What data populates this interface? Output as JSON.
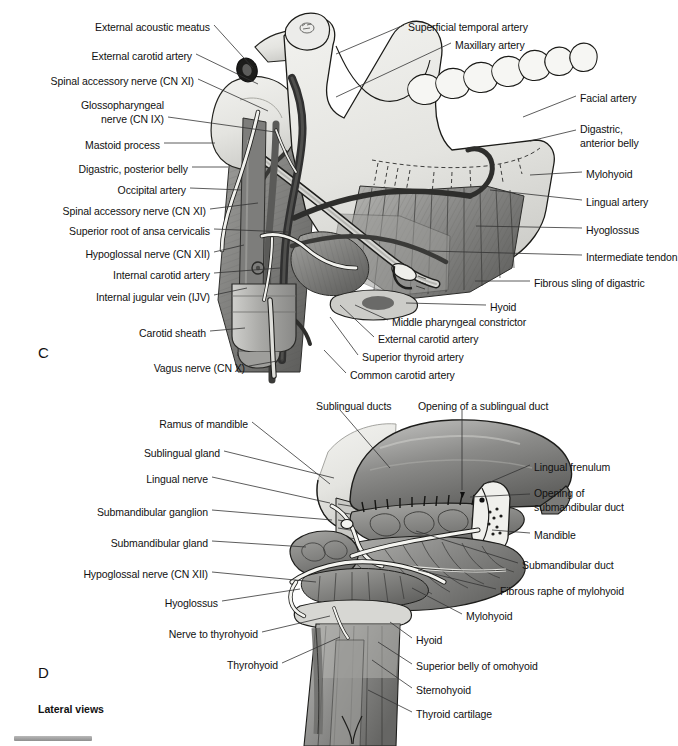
{
  "figure": {
    "caption": "Lateral views",
    "panels": [
      {
        "letter": "C",
        "x": 38,
        "y": 344
      },
      {
        "letter": "D",
        "x": 38,
        "y": 664
      }
    ]
  },
  "panel_c": {
    "labels_left": [
      {
        "text": "External acoustic meatus",
        "x": 210,
        "y": 21,
        "anchor": "right",
        "lx": 214,
        "ly": 25,
        "tx": 253,
        "ty": 68
      },
      {
        "text": "External carotid artery",
        "x": 192,
        "y": 50,
        "anchor": "right",
        "lx": 196,
        "ly": 54,
        "tx": 258,
        "ty": 84
      },
      {
        "text": "Spinal accessory nerve (CN XI)",
        "x": 194,
        "y": 75,
        "anchor": "right",
        "lx": 198,
        "ly": 79,
        "tx": 268,
        "ty": 111
      },
      {
        "text": "Glossopharyngeal",
        "x": 164,
        "y": 99,
        "anchor": "right",
        "lx": 0,
        "ly": 0,
        "tx": 0,
        "ty": 0
      },
      {
        "text": "nerve (CN IX)",
        "x": 164,
        "y": 113,
        "anchor": "right",
        "lx": 168,
        "ly": 117,
        "tx": 275,
        "ty": 132
      },
      {
        "text": "Mastoid process",
        "x": 160,
        "y": 139,
        "anchor": "right",
        "lx": 164,
        "ly": 143,
        "tx": 215,
        "ty": 143
      },
      {
        "text": "Digastric, posterior belly",
        "x": 188,
        "y": 163,
        "anchor": "right",
        "lx": 192,
        "ly": 167,
        "tx": 228,
        "ty": 167
      },
      {
        "text": "Occipital artery",
        "x": 186,
        "y": 184,
        "anchor": "right",
        "lx": 190,
        "ly": 188,
        "tx": 242,
        "ty": 190
      },
      {
        "text": "Spinal accessory nerve (CN XI)",
        "x": 206,
        "y": 205,
        "anchor": "right",
        "lx": 210,
        "ly": 209,
        "tx": 258,
        "ty": 203
      },
      {
        "text": "Superior root of ansa cervicalis",
        "x": 210,
        "y": 225,
        "anchor": "right",
        "lx": 214,
        "ly": 229,
        "tx": 288,
        "ty": 232
      },
      {
        "text": "Hypoglossal nerve (CN XII)",
        "x": 210,
        "y": 248,
        "anchor": "right",
        "lx": 214,
        "ly": 252,
        "tx": 244,
        "ty": 245
      },
      {
        "text": "Internal carotid artery",
        "x": 210,
        "y": 269,
        "anchor": "right",
        "lx": 214,
        "ly": 273,
        "tx": 280,
        "ty": 268
      },
      {
        "text": "Internal jugular vein (IJV)",
        "x": 210,
        "y": 291,
        "anchor": "right",
        "lx": 214,
        "ly": 295,
        "tx": 247,
        "ty": 288
      },
      {
        "text": "Carotid sheath",
        "x": 206,
        "y": 327,
        "anchor": "right",
        "lx": 210,
        "ly": 331,
        "tx": 245,
        "ty": 328
      },
      {
        "text": "Vagus nerve (CN X)",
        "x": 245,
        "y": 362,
        "anchor": "right",
        "lx": 249,
        "ly": 366,
        "tx": 283,
        "ty": 360
      }
    ],
    "labels_right": [
      {
        "text": "Superficial temporal artery",
        "x": 408,
        "y": 21,
        "anchor": "left",
        "lx": 404,
        "ly": 25,
        "tx": 336,
        "ty": 54
      },
      {
        "text": "Maxillary artery",
        "x": 455,
        "y": 39,
        "anchor": "left",
        "lx": 451,
        "ly": 43,
        "tx": 336,
        "ty": 97
      },
      {
        "text": "Facial artery",
        "x": 580,
        "y": 92,
        "anchor": "left",
        "lx": 576,
        "ly": 96,
        "tx": 523,
        "ty": 117
      },
      {
        "text": "Digastric,",
        "x": 580,
        "y": 123,
        "anchor": "left",
        "lx": 0,
        "ly": 0,
        "tx": 0,
        "ty": 0
      },
      {
        "text": "anterior belly",
        "x": 580,
        "y": 137,
        "anchor": "left",
        "lx": 576,
        "ly": 130,
        "tx": 530,
        "ty": 141
      },
      {
        "text": "Mylohyoid",
        "x": 586,
        "y": 168,
        "anchor": "left",
        "lx": 582,
        "ly": 172,
        "tx": 530,
        "ty": 175
      },
      {
        "text": "Lingual artery",
        "x": 586,
        "y": 196,
        "anchor": "left",
        "lx": 582,
        "ly": 200,
        "tx": 490,
        "ty": 190
      },
      {
        "text": "Hyoglossus",
        "x": 586,
        "y": 224,
        "anchor": "left",
        "lx": 582,
        "ly": 228,
        "tx": 476,
        "ty": 226
      },
      {
        "text": "Intermediate tendon",
        "x": 586,
        "y": 251,
        "anchor": "left",
        "lx": 582,
        "ly": 255,
        "tx": 428,
        "ty": 251
      },
      {
        "text": "Fibrous sling of digastric",
        "x": 534,
        "y": 277,
        "anchor": "left",
        "lx": 530,
        "ly": 281,
        "tx": 475,
        "ty": 281
      },
      {
        "text": "Hyoid",
        "x": 490,
        "y": 301,
        "anchor": "left",
        "lx": 486,
        "ly": 305,
        "tx": 406,
        "ty": 303
      },
      {
        "text": "Middle pharyngeal constrictor",
        "x": 392,
        "y": 316,
        "anchor": "left",
        "lx": 388,
        "ly": 320,
        "tx": 355,
        "ty": 305
      },
      {
        "text": "External carotid artery",
        "x": 378,
        "y": 333,
        "anchor": "left",
        "lx": 374,
        "ly": 337,
        "tx": 340,
        "ty": 305
      },
      {
        "text": "Superior thyroid artery",
        "x": 362,
        "y": 351,
        "anchor": "left",
        "lx": 358,
        "ly": 355,
        "tx": 330,
        "ty": 317
      },
      {
        "text": "Common carotid artery",
        "x": 350,
        "y": 369,
        "anchor": "left",
        "lx": 346,
        "ly": 373,
        "tx": 324,
        "ty": 350
      }
    ]
  },
  "panel_d": {
    "labels_left": [
      {
        "text": "Ramus of mandible",
        "x": 248,
        "y": 418,
        "anchor": "right",
        "lx": 252,
        "ly": 422,
        "tx": 330,
        "ty": 484
      },
      {
        "text": "Sublingual gland",
        "x": 220,
        "y": 447,
        "anchor": "right",
        "lx": 224,
        "ly": 451,
        "tx": 334,
        "ty": 478
      },
      {
        "text": "Lingual nerve",
        "x": 208,
        "y": 473,
        "anchor": "right",
        "lx": 212,
        "ly": 477,
        "tx": 330,
        "ty": 503
      },
      {
        "text": "Submandibular ganglion",
        "x": 208,
        "y": 506,
        "anchor": "right",
        "lx": 212,
        "ly": 510,
        "tx": 332,
        "ty": 520
      },
      {
        "text": "Submandibular gland",
        "x": 208,
        "y": 537,
        "anchor": "right",
        "lx": 212,
        "ly": 541,
        "tx": 306,
        "ty": 547
      },
      {
        "text": "Hypoglossal nerve (CN XII)",
        "x": 208,
        "y": 568,
        "anchor": "right",
        "lx": 212,
        "ly": 572,
        "tx": 316,
        "ty": 582
      },
      {
        "text": "Hyoglossus",
        "x": 218,
        "y": 597,
        "anchor": "right",
        "lx": 222,
        "ly": 601,
        "tx": 300,
        "ty": 589
      },
      {
        "text": "Nerve to thyrohyoid",
        "x": 258,
        "y": 628,
        "anchor": "right",
        "lx": 262,
        "ly": 632,
        "tx": 330,
        "ty": 616
      },
      {
        "text": "Thyrohyoid",
        "x": 278,
        "y": 659,
        "anchor": "right",
        "lx": 282,
        "ly": 663,
        "tx": 340,
        "ty": 637
      }
    ],
    "labels_right": [
      {
        "text": "Sublingual ducts",
        "x": 316,
        "y": 400,
        "anchor": "left",
        "lx": 340,
        "ly": 410,
        "tx": 390,
        "ty": 468
      },
      {
        "text": "Opening of a sublingual duct",
        "x": 418,
        "y": 400,
        "anchor": "left",
        "lx": 462,
        "ly": 410,
        "tx": 462,
        "ty": 490
      },
      {
        "text": "Lingual frenulum",
        "x": 534,
        "y": 461,
        "anchor": "left",
        "lx": 530,
        "ly": 465,
        "tx": 488,
        "ty": 483
      },
      {
        "text": "Opening of",
        "x": 534,
        "y": 487,
        "anchor": "left",
        "lx": 0,
        "ly": 0,
        "tx": 0,
        "ty": 0
      },
      {
        "text": "submandibular duct",
        "x": 534,
        "y": 501,
        "anchor": "left",
        "lx": 530,
        "ly": 494,
        "tx": 470,
        "ty": 497
      },
      {
        "text": "Mandible",
        "x": 534,
        "y": 529,
        "anchor": "left",
        "lx": 530,
        "ly": 533,
        "tx": 492,
        "ty": 530
      },
      {
        "text": "Submandibular duct",
        "x": 522,
        "y": 559,
        "anchor": "left",
        "lx": 518,
        "ly": 563,
        "tx": 416,
        "ty": 531
      },
      {
        "text": "Fibrous raphe of mylohyoid",
        "x": 500,
        "y": 585,
        "anchor": "left",
        "lx": 496,
        "ly": 589,
        "tx": 418,
        "ty": 570
      },
      {
        "text": "Mylohyoid",
        "x": 466,
        "y": 610,
        "anchor": "left",
        "lx": 462,
        "ly": 614,
        "tx": 412,
        "ty": 588
      },
      {
        "text": "Hyoid",
        "x": 416,
        "y": 634,
        "anchor": "left",
        "lx": 412,
        "ly": 638,
        "tx": 390,
        "ty": 622
      },
      {
        "text": "Superior belly of omohyoid",
        "x": 416,
        "y": 660,
        "anchor": "left",
        "lx": 412,
        "ly": 664,
        "tx": 378,
        "ty": 642
      },
      {
        "text": "Sternohyoid",
        "x": 416,
        "y": 684,
        "anchor": "left",
        "lx": 412,
        "ly": 688,
        "tx": 372,
        "ty": 660
      },
      {
        "text": "Thyroid cartilage",
        "x": 416,
        "y": 708,
        "anchor": "left",
        "lx": 412,
        "ly": 712,
        "tx": 368,
        "ty": 690
      }
    ]
  },
  "colors": {
    "ink": "#111111",
    "leader": "#333333",
    "bone_light": "#e9e9e6",
    "muscle_mid": "#9a9a98",
    "muscle_dark": "#6f6f6e",
    "vessel_dark": "#4a4a4a",
    "nerve_white": "#f5f5f2",
    "tongue": "#8d8d8c",
    "sheath": "#b4b4b2"
  }
}
